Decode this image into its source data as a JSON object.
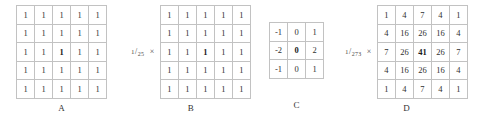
{
  "figure": {
    "type": "convolution-kernel-diagram",
    "grid_line_color": "#c2c2c2",
    "text_color": "#2f2f2f",
    "background": "#ffffff",
    "kernels": [
      {
        "id": "a",
        "caption": "A",
        "rows": 5,
        "cols": 5,
        "scale_prefix": "",
        "scale_numerator": "",
        "scale_denominator": "",
        "multiply_symbol": "",
        "has_scale": false,
        "center_bold": true,
        "values": [
          [
            1,
            1,
            1,
            1,
            1
          ],
          [
            1,
            1,
            1,
            1,
            1
          ],
          [
            1,
            1,
            1,
            1,
            1
          ],
          [
            1,
            1,
            1,
            1,
            1
          ],
          [
            1,
            1,
            1,
            1,
            1
          ]
        ]
      },
      {
        "id": "b",
        "caption": "B",
        "rows": 5,
        "cols": 5,
        "scale_numerator": "1",
        "scale_denominator": "25",
        "multiply_symbol": "×",
        "has_scale": true,
        "center_bold": true,
        "values": [
          [
            1,
            1,
            1,
            1,
            1
          ],
          [
            1,
            1,
            1,
            1,
            1
          ],
          [
            1,
            1,
            1,
            1,
            1
          ],
          [
            1,
            1,
            1,
            1,
            1
          ],
          [
            1,
            1,
            1,
            1,
            1
          ]
        ]
      },
      {
        "id": "c",
        "caption": "C",
        "rows": 3,
        "cols": 3,
        "scale_numerator": "",
        "scale_denominator": "",
        "multiply_symbol": "",
        "has_scale": false,
        "center_bold": true,
        "values": [
          [
            -1,
            0,
            1
          ],
          [
            -2,
            0,
            2
          ],
          [
            -1,
            0,
            1
          ]
        ]
      },
      {
        "id": "d",
        "caption": "D",
        "rows": 5,
        "cols": 5,
        "scale_numerator": "1",
        "scale_denominator": "273",
        "multiply_symbol": "×",
        "has_scale": true,
        "center_bold": true,
        "values": [
          [
            1,
            4,
            7,
            4,
            1
          ],
          [
            4,
            16,
            26,
            16,
            4
          ],
          [
            7,
            26,
            41,
            26,
            7
          ],
          [
            4,
            16,
            26,
            16,
            4
          ],
          [
            1,
            4,
            7,
            4,
            1
          ]
        ]
      }
    ]
  }
}
